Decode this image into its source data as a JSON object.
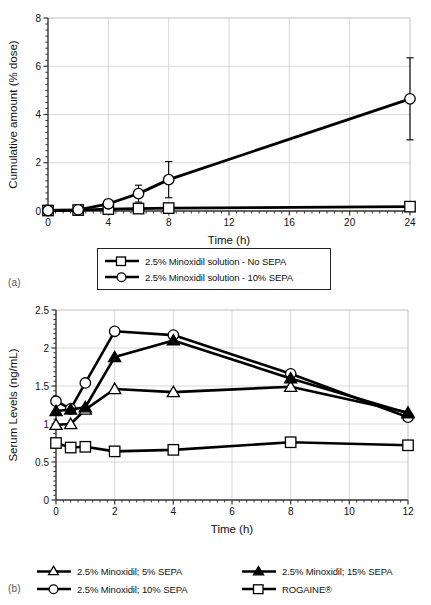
{
  "figure": {
    "panel_a_letter": "(a)",
    "panel_b_letter": "(b)"
  },
  "chart_data": [
    {
      "id": "panel-a",
      "type": "line",
      "title": "",
      "xlabel": "Time (h)",
      "ylabel": "Cumulative amount (% dose)",
      "xlim": [
        0,
        24
      ],
      "ylim": [
        0,
        8
      ],
      "xticks": [
        0,
        4,
        8,
        12,
        16,
        20,
        24
      ],
      "xticklabels": [
        "0",
        "4",
        "8",
        "12",
        "16",
        "20",
        "24"
      ],
      "yticks": [
        0,
        2,
        4,
        6,
        8
      ],
      "yticklabels": [
        "0",
        "2",
        "4",
        "6",
        "8"
      ],
      "grid": true,
      "legend_position": "below-center",
      "x": [
        0,
        2,
        4,
        6,
        8,
        24
      ],
      "series": [
        {
          "name": "2.5% Minoxidil solution - No SEPA",
          "marker": "open-square",
          "values": [
            0.02,
            0.04,
            0.08,
            0.1,
            0.12,
            0.18
          ],
          "errors": [
            0,
            0.03,
            0.05,
            0.06,
            0.07,
            0.09
          ]
        },
        {
          "name": "2.5% Minoxidil solution - 10% SEPA",
          "marker": "open-circle",
          "values": [
            0.02,
            0.05,
            0.3,
            0.72,
            1.3,
            4.65
          ],
          "errors": [
            0,
            0.04,
            0.12,
            0.35,
            0.75,
            1.7
          ]
        }
      ]
    },
    {
      "id": "panel-b",
      "type": "line",
      "title": "",
      "xlabel": "Time (h)",
      "ylabel": "Serum Levels (ng/mL)",
      "xlim": [
        0,
        12
      ],
      "ylim": [
        0,
        2.5
      ],
      "xticks": [
        0,
        2,
        4,
        6,
        8,
        10,
        12
      ],
      "xticklabels": [
        "0",
        "2",
        "4",
        "6",
        "8",
        "10",
        "12"
      ],
      "yticks": [
        0,
        0.5,
        1,
        1.5,
        2,
        2.5
      ],
      "yticklabels": [
        "0",
        "0.5",
        "1",
        "1.5",
        "2",
        "2.5"
      ],
      "grid": true,
      "legend_position": "below",
      "x": [
        0,
        0.5,
        1,
        2,
        4,
        8,
        12
      ],
      "series": [
        {
          "name": "2.5% Minoxidil; 5% SEPA",
          "marker": "open-triangle",
          "values": [
            0.99,
            1.0,
            1.19,
            1.46,
            1.42,
            1.49,
            1.15
          ]
        },
        {
          "name": "2.5% Minoxidil; 10% SEPA",
          "marker": "open-circle",
          "values": [
            1.3,
            1.2,
            1.54,
            2.22,
            2.17,
            1.66,
            1.09
          ]
        },
        {
          "name": "2.5% Minoxidil; 15% SEPA",
          "marker": "filled-triangle",
          "values": [
            1.17,
            1.19,
            1.22,
            1.88,
            2.1,
            1.6,
            1.14
          ]
        },
        {
          "name": "ROGAINE®",
          "marker": "open-square",
          "values": [
            0.75,
            0.69,
            0.7,
            0.64,
            0.66,
            0.76,
            0.72
          ]
        }
      ]
    }
  ],
  "legend_a": {
    "items": [
      {
        "label": "2.5% Minoxidil solution - No SEPA",
        "marker": "open-square"
      },
      {
        "label": "2.5% Minoxidil solution - 10% SEPA",
        "marker": "open-circle"
      }
    ]
  },
  "legend_b": {
    "items": [
      {
        "label": "2.5% Minoxidil; 5% SEPA",
        "marker": "open-triangle"
      },
      {
        "label": "2.5% Minoxidil; 15% SEPA",
        "marker": "filled-triangle"
      },
      {
        "label": "2.5% Minoxidil; 10% SEPA",
        "marker": "open-circle"
      },
      {
        "label": "ROGAINE®",
        "marker": "open-square"
      }
    ]
  },
  "colors": {
    "line": "#000000",
    "grid": "#c9c9c9",
    "axis": "#333333",
    "text": "#111111",
    "background": "#ffffff"
  }
}
